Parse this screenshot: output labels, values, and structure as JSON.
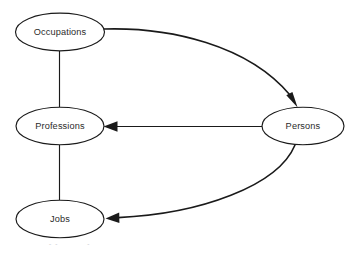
{
  "diagram": {
    "type": "directed-graph",
    "background_color": "#ffffff",
    "stroke_color": "#1a1a1a",
    "text_color": "#2b2b2b",
    "nodes": [
      {
        "id": "occupations",
        "label": "Occupations",
        "cx": 60,
        "cy": 32,
        "rx": 45,
        "ry": 19
      },
      {
        "id": "professions",
        "label": "Professions",
        "cx": 60,
        "cy": 126,
        "rx": 44,
        "ry": 19
      },
      {
        "id": "jobs",
        "label": "Jobs",
        "cx": 60,
        "cy": 219,
        "rx": 44,
        "ry": 19
      },
      {
        "id": "persons",
        "label": "Persons",
        "cx": 303,
        "cy": 126,
        "rx": 41,
        "ry": 19
      }
    ],
    "edges": [
      {
        "id": "occupations-professions",
        "from": "Occupations",
        "to": "Professions",
        "style": "straight-line",
        "arrow": false
      },
      {
        "id": "professions-jobs",
        "from": "Professions",
        "to": "Jobs",
        "style": "straight-line",
        "arrow": false
      },
      {
        "id": "occupations-persons",
        "from": "Occupations",
        "to": "Persons",
        "style": "curved",
        "arrow": true
      },
      {
        "id": "persons-professions",
        "from": "Persons",
        "to": "Professions",
        "style": "straight-line",
        "arrow": true
      },
      {
        "id": "persons-jobs",
        "from": "Persons",
        "to": "Jobs",
        "style": "curved",
        "arrow": true
      }
    ]
  },
  "caption": {
    "partial_text": "clipped caption line"
  }
}
